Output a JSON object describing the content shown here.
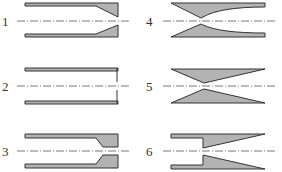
{
  "diagram": {
    "type": "nozzle-profile-types",
    "colors": {
      "fill": "#b3b3b3",
      "stroke": "#333333",
      "centerline": "#555555",
      "label": "#333333"
    },
    "items": [
      {
        "id": 1,
        "label": "1",
        "shape": "cylindrical tube with converging conical end (external taper)"
      },
      {
        "id": 2,
        "label": "2",
        "shape": "cylindrical tube with flat end plate (orifice)"
      },
      {
        "id": 3,
        "label": "3",
        "shape": "cylindrical tube with converging-then-straight tip"
      },
      {
        "id": 4,
        "label": "4",
        "shape": "curved convergent-divergent (Laval-type) profile"
      },
      {
        "id": 5,
        "label": "5",
        "shape": "straight convergent-divergent (conical) profile"
      },
      {
        "id": 6,
        "label": "6",
        "shape": "stepped tube with divergent conical exit"
      }
    ]
  }
}
